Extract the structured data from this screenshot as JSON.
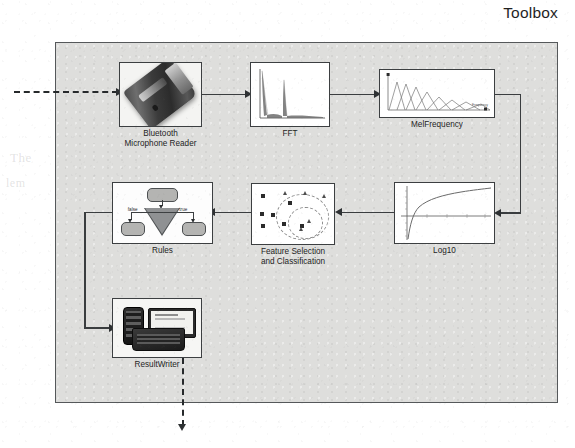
{
  "figure": {
    "title": "Toolbox",
    "kind": "block-diagram",
    "background_color": "#dededc",
    "frame_border_color": "#55585a"
  },
  "blocks": [
    {
      "id": "bluetooth-microphone-reader",
      "caption": "Bluetooth\nMicrophone Reader",
      "caption_line1": "Bluetooth",
      "caption_line2": "Microphone Reader",
      "artwork": "photo-of-bluetooth-usb-dongle"
    },
    {
      "id": "fft",
      "caption": "FFT",
      "artwork": "frequency-spectrum-plot"
    },
    {
      "id": "mel-frequency",
      "caption": "MelFrequency",
      "artwork": "triangular-mel-filterbank-plot",
      "axis_label": "Frequency"
    },
    {
      "id": "log10",
      "caption": "Log10",
      "artwork": "logarithmic-curve-plot"
    },
    {
      "id": "feature-selection-and-classification",
      "caption": "Feature Selection\nand Classification",
      "caption_line1": "Feature Selection",
      "caption_line2": "and Classification",
      "artwork": "scatter-plot-with-cluster-boundaries"
    },
    {
      "id": "rules",
      "caption": "Rules",
      "artwork": "decision-tree",
      "branch_label_false": "false",
      "branch_label_true": "true"
    },
    {
      "id": "result-writer",
      "caption": "ResultWriter",
      "artwork": "photo-of-phone-monitor-and-laptop"
    }
  ],
  "connections": [
    {
      "from": "external-input",
      "to": "bluetooth-microphone-reader",
      "style": "dashed"
    },
    {
      "from": "bluetooth-microphone-reader",
      "to": "fft",
      "style": "solid"
    },
    {
      "from": "fft",
      "to": "mel-frequency",
      "style": "solid"
    },
    {
      "from": "mel-frequency",
      "to": "log10",
      "style": "solid"
    },
    {
      "from": "log10",
      "to": "feature-selection-and-classification",
      "style": "solid"
    },
    {
      "from": "feature-selection-and-classification",
      "to": "rules",
      "style": "solid"
    },
    {
      "from": "rules",
      "to": "result-writer",
      "style": "solid"
    },
    {
      "from": "result-writer",
      "to": "external-output",
      "style": "dashed"
    }
  ],
  "background_ghost_text": [
    "The",
    "lem",
    "1"
  ]
}
